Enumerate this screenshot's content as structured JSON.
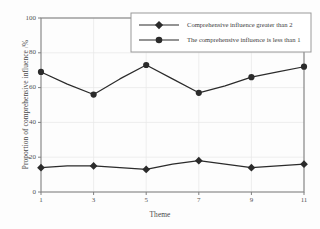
{
  "chart_data": {
    "type": "line",
    "title": "",
    "xlabel": "Theme",
    "ylabel": "Proportion of comprehensive influence /%",
    "x": [
      1,
      2,
      3,
      4,
      5,
      6,
      7,
      8,
      9,
      10,
      11
    ],
    "xtick_labels": [
      "1",
      "3",
      "5",
      "7",
      "9",
      "11"
    ],
    "xtick_values": [
      1,
      3,
      5,
      7,
      9,
      11
    ],
    "ytick_labels": [
      "0",
      "20",
      "40",
      "60",
      "80",
      "100"
    ],
    "ytick_values": [
      0,
      20,
      40,
      60,
      80,
      100
    ],
    "xlim": [
      1,
      11
    ],
    "ylim": [
      0,
      100
    ],
    "grid": true,
    "legend_position": "upper right",
    "series": [
      {
        "name": "Comprehensive influence greater than 2",
        "marker": "diamond",
        "color": "#2b2b2b",
        "values": [
          14,
          15,
          15,
          14,
          13,
          16,
          18,
          16,
          14,
          15,
          16
        ]
      },
      {
        "name": "The comprehensive influence is less than 1",
        "marker": "circle",
        "color": "#2b2b2b",
        "values": [
          69,
          62,
          56,
          65,
          73,
          65,
          57,
          61,
          66,
          69,
          72
        ]
      }
    ]
  },
  "legend": {
    "items": [
      {
        "label": "Comprehensive influence greater than 2",
        "marker": "diamond"
      },
      {
        "label": "The comprehensive influence is less than 1",
        "marker": "circle"
      }
    ]
  },
  "colors": {
    "series": "#2b2b2b",
    "axis": "#808080",
    "grid": "#e8e8e8",
    "legend_border": "#9a9a9a",
    "text": "#4a4a4a"
  }
}
